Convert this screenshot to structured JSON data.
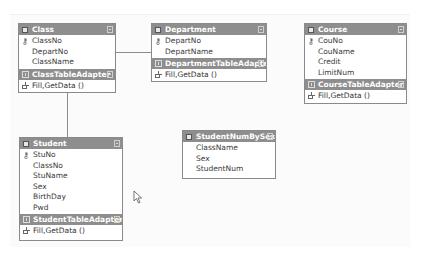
{
  "designer": {
    "tables": {
      "class": {
        "title": "Class",
        "fields": [
          "ClassNo",
          "DepartNo",
          "ClassName"
        ],
        "primary_key": "ClassNo",
        "adapter": {
          "title": "ClassTableAdapter",
          "method": "Fill,GetData ()"
        }
      },
      "department": {
        "title": "Department",
        "fields": [
          "DepartNo",
          "DepartName"
        ],
        "primary_key": "DepartNo",
        "adapter": {
          "title": "DepartmentTableAdapter",
          "method": "Fill,GetData ()"
        }
      },
      "course": {
        "title": "Course",
        "fields": [
          "CouNo",
          "CouName",
          "Credit",
          "LimitNum"
        ],
        "primary_key": "CouNo",
        "adapter": {
          "title": "CourseTableAdapter",
          "method": "Fill,GetData ()"
        }
      },
      "student": {
        "title": "Student",
        "fields": [
          "StuNo",
          "ClassNo",
          "StuName",
          "Sex",
          "BirthDay",
          "Pwd"
        ],
        "primary_key": "StuNo",
        "adapter": {
          "title": "StudentTableAdapter",
          "method": "Fill,GetData ()"
        }
      },
      "studentNumBySex": {
        "title": "StudentNumBySex",
        "fields": [
          "ClassName",
          "Sex",
          "StudentNum"
        ]
      }
    },
    "colors": {
      "header_bg": "#8e8e8e",
      "border": "#8a8a8a",
      "relation_line": "#8c8c8c"
    }
  }
}
